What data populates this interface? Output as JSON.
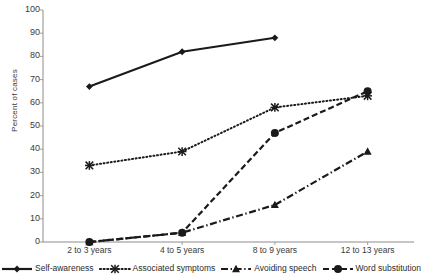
{
  "chart_data": {
    "type": "line",
    "title": "",
    "xlabel": "",
    "ylabel": "Percent of cases",
    "categories": [
      "2 to 3 years",
      "4 to 5 years",
      "8 to 9 years",
      "12 to 13 years"
    ],
    "ylim": [
      0,
      100
    ],
    "yticks": [
      0,
      10,
      20,
      30,
      40,
      50,
      60,
      70,
      80,
      90,
      100
    ],
    "grid": false,
    "legend_position": "bottom",
    "series": [
      {
        "name": "Self-awareness",
        "marker": "diamond",
        "line_style": "solid",
        "color": "#1a1a1a",
        "values": [
          67,
          82,
          88,
          null
        ]
      },
      {
        "name": "Associated symptoms",
        "marker": "x",
        "line_style": "dotted",
        "color": "#1a1a1a",
        "values": [
          33,
          39,
          58,
          63
        ]
      },
      {
        "name": "Avoiding speech",
        "marker": "triangle",
        "line_style": "dashdot",
        "color": "#1a1a1a",
        "values": [
          0,
          4,
          16,
          39
        ]
      },
      {
        "name": "Word substitution",
        "marker": "circle",
        "line_style": "dashed",
        "color": "#1a1a1a",
        "values": [
          0,
          4,
          47,
          65
        ]
      }
    ]
  },
  "axis": {
    "line_color": "#8c8c8c"
  }
}
